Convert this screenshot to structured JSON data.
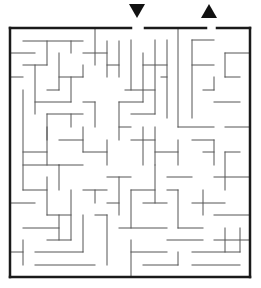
{
  "puzzle": {
    "type": "maze",
    "start_marker": "down-arrow",
    "end_marker": "up-arrow",
    "wall_color": "#555555",
    "border_color": "#1a1a1a",
    "background": "#ffffff"
  },
  "border": {
    "segments": [
      [
        10,
        28,
        131,
        28
      ],
      [
        145,
        28,
        206,
        28
      ],
      [
        217,
        28,
        250,
        28
      ],
      [
        250,
        28,
        250,
        277
      ],
      [
        250,
        277,
        10,
        277
      ],
      [
        10,
        277,
        10,
        28
      ]
    ]
  },
  "walls": [
    [
      23,
      41,
      83,
      41
    ],
    [
      47,
      41,
      47,
      65
    ],
    [
      71,
      41,
      71,
      53
    ],
    [
      95,
      28,
      95,
      65
    ],
    [
      107,
      41,
      107,
      77
    ],
    [
      11,
      53,
      35,
      53
    ],
    [
      83,
      53,
      107,
      53
    ],
    [
      119,
      41,
      119,
      77
    ],
    [
      107,
      65,
      119,
      65
    ],
    [
      23,
      65,
      47,
      65
    ],
    [
      35,
      65,
      35,
      114
    ],
    [
      59,
      53,
      59,
      90
    ],
    [
      59,
      77,
      83,
      77
    ],
    [
      83,
      65,
      83,
      77
    ],
    [
      11,
      77,
      23,
      77
    ],
    [
      47,
      90,
      59,
      90
    ],
    [
      71,
      77,
      71,
      102
    ],
    [
      35,
      102,
      71,
      102
    ],
    [
      47,
      114,
      83,
      114
    ],
    [
      47,
      114,
      47,
      140
    ],
    [
      71,
      114,
      71,
      127
    ],
    [
      83,
      102,
      95,
      102
    ],
    [
      95,
      102,
      95,
      127
    ],
    [
      23,
      90,
      23,
      190
    ],
    [
      23,
      152,
      47,
      152
    ],
    [
      23,
      165,
      59,
      165
    ],
    [
      47,
      127,
      47,
      165
    ],
    [
      59,
      140,
      83,
      140
    ],
    [
      83,
      127,
      83,
      152
    ],
    [
      59,
      165,
      83,
      165
    ],
    [
      59,
      165,
      59,
      190
    ],
    [
      83,
      152,
      107,
      152
    ],
    [
      107,
      140,
      107,
      165
    ],
    [
      131,
      40,
      131,
      90
    ],
    [
      125,
      90,
      155,
      90
    ],
    [
      143,
      53,
      143,
      102
    ],
    [
      155,
      40,
      155,
      114
    ],
    [
      131,
      114,
      155,
      114
    ],
    [
      167,
      40,
      167,
      118
    ],
    [
      143,
      65,
      167,
      65
    ],
    [
      161,
      77,
      167,
      77
    ],
    [
      178,
      28,
      178,
      127
    ],
    [
      178,
      127,
      214,
      127
    ],
    [
      192,
      40,
      214,
      40
    ],
    [
      192,
      40,
      192,
      118
    ],
    [
      192,
      65,
      214,
      65
    ],
    [
      214,
      77,
      214,
      90
    ],
    [
      203,
      90,
      214,
      90
    ],
    [
      214,
      102,
      240,
      102
    ],
    [
      225,
      77,
      240,
      77
    ],
    [
      225,
      53,
      225,
      77
    ],
    [
      225,
      53,
      250,
      53
    ],
    [
      225,
      127,
      250,
      127
    ],
    [
      119,
      102,
      143,
      102
    ],
    [
      119,
      102,
      119,
      140
    ],
    [
      119,
      127,
      131,
      127
    ],
    [
      131,
      140,
      155,
      140
    ],
    [
      143,
      127,
      143,
      165
    ],
    [
      155,
      127,
      155,
      165
    ],
    [
      155,
      152,
      178,
      152
    ],
    [
      178,
      140,
      178,
      165
    ],
    [
      192,
      140,
      214,
      140
    ],
    [
      214,
      140,
      214,
      165
    ],
    [
      203,
      152,
      214,
      152
    ],
    [
      225,
      152,
      240,
      152
    ],
    [
      225,
      152,
      225,
      190
    ],
    [
      214,
      177,
      250,
      177
    ],
    [
      11,
      203,
      35,
      203
    ],
    [
      23,
      190,
      47,
      190
    ],
    [
      47,
      177,
      47,
      215
    ],
    [
      47,
      215,
      71,
      215
    ],
    [
      71,
      190,
      71,
      240
    ],
    [
      23,
      228,
      59,
      228
    ],
    [
      59,
      215,
      59,
      240
    ],
    [
      47,
      240,
      71,
      240
    ],
    [
      11,
      252,
      23,
      252
    ],
    [
      23,
      240,
      23,
      265
    ],
    [
      35,
      252,
      83,
      252
    ],
    [
      35,
      265,
      95,
      265
    ],
    [
      83,
      215,
      83,
      252
    ],
    [
      95,
      215,
      107,
      215
    ],
    [
      107,
      215,
      107,
      265
    ],
    [
      83,
      190,
      107,
      190
    ],
    [
      95,
      190,
      95,
      203
    ],
    [
      107,
      177,
      131,
      177
    ],
    [
      119,
      177,
      119,
      215
    ],
    [
      107,
      203,
      119,
      203
    ],
    [
      131,
      190,
      155,
      190
    ],
    [
      131,
      190,
      131,
      228
    ],
    [
      119,
      228,
      167,
      228
    ],
    [
      143,
      203,
      167,
      203
    ],
    [
      155,
      165,
      155,
      203
    ],
    [
      167,
      177,
      192,
      177
    ],
    [
      167,
      190,
      178,
      190
    ],
    [
      178,
      190,
      178,
      228
    ],
    [
      167,
      240,
      203,
      240
    ],
    [
      178,
      228,
      203,
      228
    ],
    [
      192,
      203,
      225,
      203
    ],
    [
      203,
      190,
      203,
      215
    ],
    [
      214,
      215,
      250,
      215
    ],
    [
      225,
      228,
      225,
      252
    ],
    [
      192,
      252,
      240,
      252
    ],
    [
      131,
      252,
      167,
      252
    ],
    [
      131,
      240,
      131,
      277
    ],
    [
      143,
      265,
      178,
      265
    ],
    [
      178,
      252,
      178,
      265
    ],
    [
      192,
      265,
      240,
      265
    ],
    [
      214,
      240,
      250,
      240
    ],
    [
      240,
      228,
      240,
      252
    ]
  ]
}
